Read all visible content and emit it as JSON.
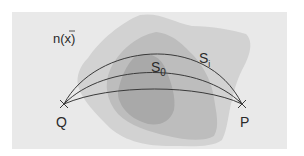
{
  "diagram": {
    "labels": {
      "field": "n(x̄)",
      "field_base": "n(x)",
      "path_i_base": "S",
      "path_i_sub": "i",
      "path_0_base": "S",
      "path_0_sub": "0",
      "start": "Q",
      "end": "P"
    },
    "points": {
      "Q": {
        "x": 64,
        "y": 104
      },
      "P": {
        "x": 242,
        "y": 104
      }
    },
    "colors": {
      "background": "#ffffff",
      "panel": "#e9e9e9",
      "region_outer": "#d2d2d2",
      "region_mid": "#bdbdbd",
      "region_inner": "#a9a9a9",
      "curve": "#3a3a3a"
    },
    "curves": [
      "S_i (upper)",
      "S_0 (middle)",
      "lower path"
    ]
  }
}
